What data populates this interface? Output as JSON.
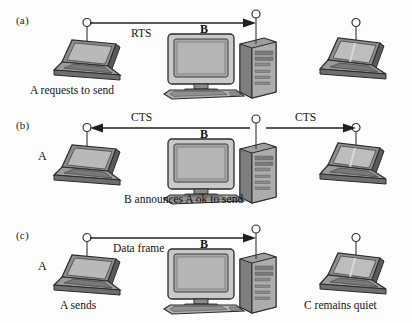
{
  "figure": {
    "background_color": "#fdfdfd",
    "ink_color": "#141414"
  },
  "panels": [
    {
      "id": "a",
      "label": "(a)",
      "arrow_label": "RTS",
      "nodes": [
        {
          "id": "A",
          "type": "laptop",
          "label": "",
          "caption": "A requests to send"
        },
        {
          "id": "B",
          "type": "desktop",
          "label": "B",
          "caption": ""
        },
        {
          "id": "C",
          "type": "laptop",
          "label": "C",
          "caption": ""
        }
      ],
      "arrows": [
        {
          "name": "rts-arrow",
          "from": "A",
          "to": "B",
          "direction": "right",
          "label": "RTS"
        }
      ]
    },
    {
      "id": "b",
      "label": "(b)",
      "arrow_label": "CTS",
      "nodes": [
        {
          "id": "A",
          "type": "laptop",
          "label": "A",
          "caption": ""
        },
        {
          "id": "B",
          "type": "desktop",
          "label": "B",
          "caption": "B announces A ok to send"
        },
        {
          "id": "C",
          "type": "laptop",
          "label": "C",
          "caption": ""
        }
      ],
      "arrows": [
        {
          "name": "cts-arrow-left",
          "from": "B",
          "to": "A",
          "direction": "left",
          "label": "CTS"
        },
        {
          "name": "cts-arrow-right",
          "from": "B",
          "to": "C",
          "direction": "right",
          "label": "CTS"
        }
      ]
    },
    {
      "id": "c",
      "label": "(c)",
      "arrow_label": "Data frame",
      "nodes": [
        {
          "id": "A",
          "type": "laptop",
          "label": "A",
          "caption": "A sends"
        },
        {
          "id": "B",
          "type": "desktop",
          "label": "B",
          "caption": ""
        },
        {
          "id": "C",
          "type": "laptop",
          "label": "C",
          "caption": "C remains quiet"
        }
      ],
      "arrows": [
        {
          "name": "data-frame-arrow",
          "from": "A",
          "to": "B",
          "direction": "right",
          "label": "Data frame"
        }
      ]
    }
  ],
  "labels": {
    "panel_a": "(a)",
    "panel_b": "(b)",
    "panel_c": "(c)",
    "rts": "RTS",
    "cts_left": "CTS",
    "cts_right": "CTS",
    "data_frame": "Data frame",
    "b_a": "B",
    "b_b": "B",
    "b_c": "B",
    "c_a": "C",
    "a_b": "A",
    "c_b": "C",
    "a_c": "A",
    "c_c": "C",
    "caption_a": "A requests to send",
    "caption_b": "B announces A ok to send",
    "caption_c_left": "A sends",
    "caption_c_right": "C remains quiet"
  }
}
